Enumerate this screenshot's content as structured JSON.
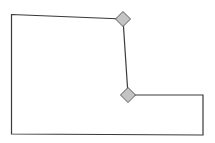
{
  "canvas": {
    "width": 215,
    "height": 143,
    "background": "#ffffff"
  },
  "shape": {
    "type": "polygon",
    "stroke_color": "#3a3a3a",
    "points": [
      [
        11.5,
        14.5
      ],
      [
        123,
        19
      ],
      [
        128,
        95
      ],
      [
        203,
        95
      ],
      [
        203,
        135
      ],
      [
        11.5,
        134
      ]
    ]
  },
  "handles": [
    {
      "name": "vertex-handle-top",
      "cx": 123,
      "cy": 19,
      "size": 7.5,
      "fill": "#c4c4c4",
      "stroke": "#5a5a5a"
    },
    {
      "name": "vertex-handle-middle",
      "cx": 128,
      "cy": 95,
      "size": 7.5,
      "fill": "#c4c4c4",
      "stroke": "#5a5a5a"
    }
  ]
}
